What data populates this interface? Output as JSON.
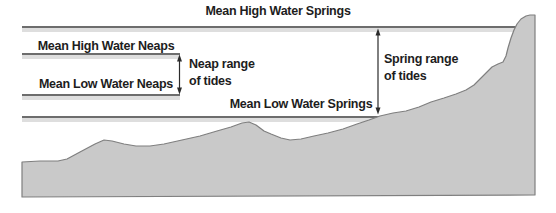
{
  "diagram": {
    "type": "tidal-range-cross-section",
    "labels": {
      "mean_high_water_springs": "Mean High Water Springs",
      "mean_high_water_neaps": "Mean High Water Neaps",
      "mean_low_water_neaps": "Mean Low Water Neaps",
      "mean_low_water_springs": "Mean Low Water Springs",
      "neap_range": "Neap range\nof tides",
      "spring_range": "Spring range\nof tides"
    },
    "colors": {
      "background": "#ffffff",
      "terrain_fill": "#c9c9c9",
      "terrain_stroke": "#7f7f7f",
      "tide_line": "#3d3d3d",
      "tide_line_shadow": "#dedede",
      "arrow": "#2b2b2b",
      "text": "#1d1d1d"
    }
  }
}
